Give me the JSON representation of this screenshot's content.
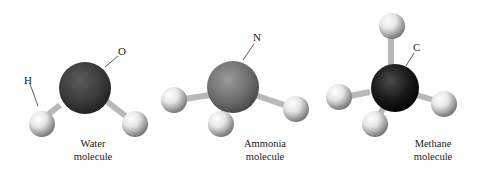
{
  "figure": {
    "molecules": [
      {
        "id": "water",
        "central_atom": "O",
        "caption_line1": "Water",
        "caption_line2": "molecule",
        "labels": {
          "central": "O",
          "hydrogen": "H"
        },
        "central_color": "#3a3a3a"
      },
      {
        "id": "ammonia",
        "central_atom": "N",
        "caption_line1": "Ammonia",
        "caption_line2": "molecule",
        "labels": {
          "central": "N"
        },
        "central_color": "#6e6e6e"
      },
      {
        "id": "methane",
        "central_atom": "C",
        "caption_line1": "Methane",
        "caption_line2": "molecule",
        "labels": {
          "central": "C"
        },
        "central_color": "#1a1a1a"
      }
    ]
  }
}
